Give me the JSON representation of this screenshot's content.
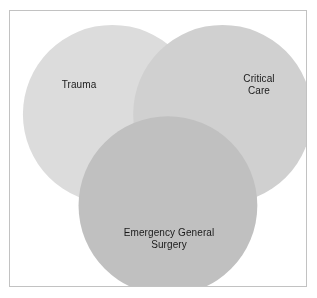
{
  "figure": {
    "type": "venn-diagram",
    "background_color": "#ffffff",
    "border_color": "#c2c2c2",
    "label_color": "#1a1a1a",
    "set_count": 3
  },
  "chart_data": {
    "type": "venn",
    "title": "",
    "subtitle": "",
    "xlabel": "",
    "ylabel": "",
    "grid": false,
    "legend": "none",
    "blend_mode": "multiply",
    "sets": [
      {
        "id": "trauma",
        "label": "Trauma",
        "color": "#dcdcdc",
        "cx": 103,
        "cy": 104,
        "r": 90,
        "label_x": 69,
        "label_y": 74
      },
      {
        "id": "critical-care",
        "label": "Critical Care",
        "color": "#d0d0d0",
        "cx": 214,
        "cy": 104,
        "r": 90,
        "label_x": 249,
        "label_y": 74
      },
      {
        "id": "emergency-general-surgery",
        "label": "Emergency General\nSurgery",
        "color": "#c0c0c0",
        "cx": 159,
        "cy": 196,
        "r": 90,
        "label_x": 159,
        "label_y": 228
      }
    ]
  }
}
